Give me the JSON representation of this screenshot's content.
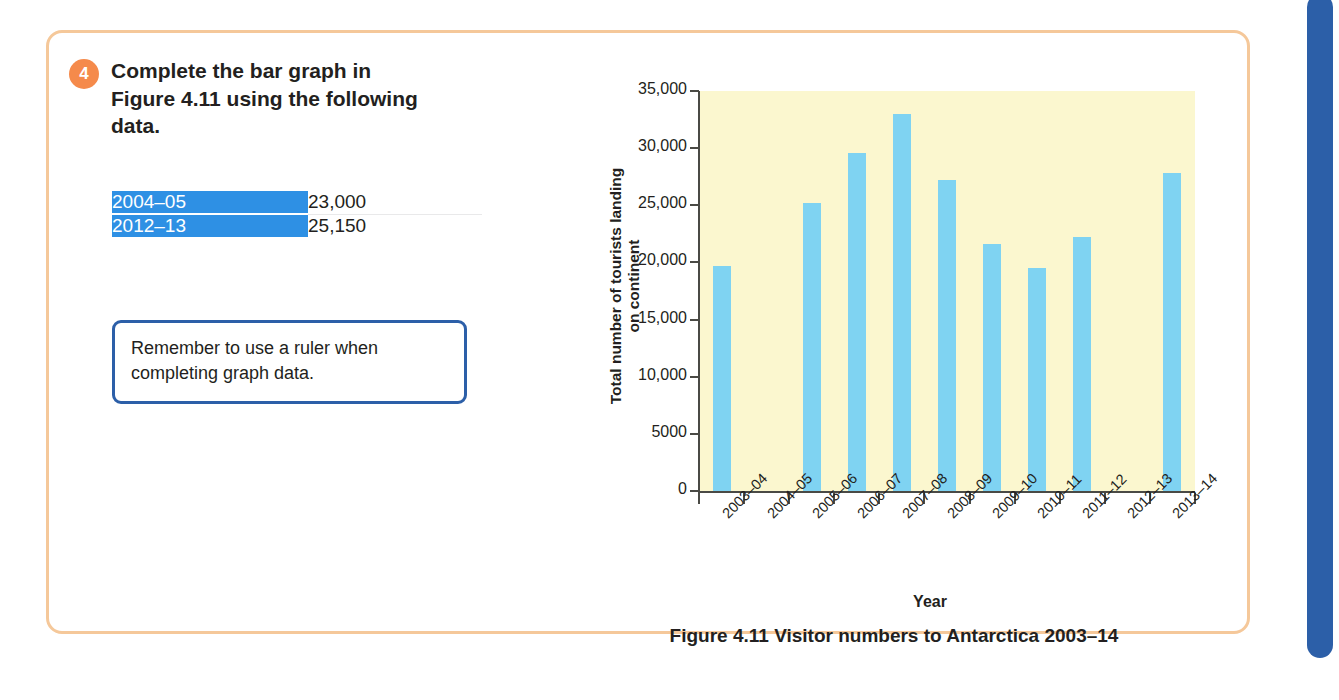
{
  "question": {
    "number": "4",
    "text": "Complete the bar graph in Figure 4.11 using the following data.",
    "marks_badge": "2 marks"
  },
  "data_table": {
    "rows": [
      {
        "year": "2004–05",
        "value": "23,000"
      },
      {
        "year": "2012–13",
        "value": "25,150"
      }
    ]
  },
  "tip": {
    "text": "Remember to use a ruler when completing graph data."
  },
  "figure": {
    "caption": "Figure 4.11 Visitor numbers to Antarctica 2003–14"
  },
  "colors": {
    "card_border": "#f5c89a",
    "badge_orange": "#f58a4b",
    "table_blue": "#2e90e4",
    "tip_border": "#2c5fa8",
    "plot_background": "#fbf7cf",
    "bar_blue": "#7fd3f2",
    "page_tab_blue": "#2c5fa8"
  },
  "chart_data": {
    "type": "bar",
    "title": "Figure 4.11 Visitor numbers to Antarctica 2003–14",
    "xlabel": "Year",
    "ylabel": "Total number of tourists landing on continent",
    "ylabel_lines": [
      "Total number of tourists landing",
      "on continent"
    ],
    "ylim": [
      0,
      35000
    ],
    "yticks": [
      0,
      5000,
      10000,
      15000,
      20000,
      25000,
      30000,
      35000
    ],
    "ytick_labels": [
      "0",
      "5000",
      "10,000",
      "15,000",
      "20,000",
      "25,000",
      "30,000",
      "35,000"
    ],
    "grid": false,
    "legend": null,
    "categories": [
      "2003–04",
      "2004–05",
      "2005–06",
      "2006–07",
      "2007–08",
      "2008–09",
      "2009–10",
      "2010–11",
      "2011–12",
      "2012–13",
      "2013–14"
    ],
    "values": [
      19700,
      null,
      25200,
      29600,
      33000,
      27200,
      21600,
      19500,
      22200,
      null,
      27800
    ],
    "missing_note": "Bars for 2004–05 and 2012–13 are blank — to be completed by the student"
  }
}
